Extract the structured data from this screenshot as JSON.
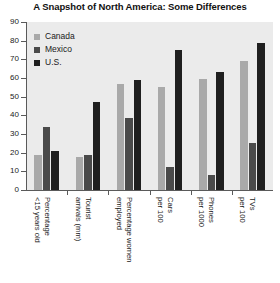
{
  "chart_data": {
    "type": "bar",
    "title": "A Snapshot of North America: Some Differences",
    "xlabel": "",
    "ylabel": "",
    "ylim": [
      0,
      90
    ],
    "yticks": [
      0,
      10,
      20,
      30,
      40,
      50,
      60,
      70,
      80,
      90
    ],
    "grid": false,
    "legend_position": "upper-left-inside",
    "categories": [
      "Percentage <15 years old",
      "Tourist arrivals (mm)",
      "Percentage women employed",
      "Cars per 100",
      "Phones per 1000",
      "TVs per 100"
    ],
    "category_lines": [
      [
        "Percentage",
        "<15 years old"
      ],
      [
        "Tourist",
        "arrivals (mm)"
      ],
      [
        "Percentage women",
        "employed"
      ],
      [
        "Cars",
        "per 100"
      ],
      [
        "Phones",
        "per 1000"
      ],
      [
        "TVs",
        "per 100"
      ]
    ],
    "series": [
      {
        "name": "Canada",
        "color": "#a9a9a9",
        "values": [
          19,
          17.5,
          57,
          55,
          59.5,
          69
        ]
      },
      {
        "name": "Mexico",
        "color": "#4a4a4a",
        "values": [
          33.5,
          18.5,
          38.5,
          12.5,
          8,
          25
        ]
      },
      {
        "name": "U.S.",
        "color": "#1f1f1f",
        "values": [
          21,
          47,
          59,
          75,
          63,
          78.5
        ]
      }
    ]
  },
  "legend": {
    "items": [
      {
        "label": "Canada"
      },
      {
        "label": "Mexico"
      },
      {
        "label": "U.S."
      }
    ]
  }
}
